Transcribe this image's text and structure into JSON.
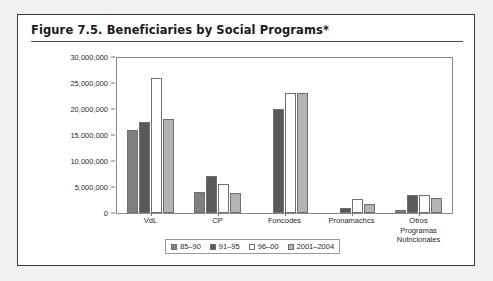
{
  "figure": {
    "title": "Figure 7.5.  Beneficiaries by Social Programs*"
  },
  "chart_data": {
    "type": "bar",
    "title": "Figure 7.5.  Beneficiaries by Social Programs*",
    "xlabel": "",
    "ylabel": "",
    "ylim": [
      0,
      30000000
    ],
    "ytick_labels": [
      "30,000,000",
      "25,000,000",
      "20,000,000",
      "15,000,000",
      "10,000,000",
      "5,000,000",
      "0"
    ],
    "ytick_values": [
      30000000,
      25000000,
      20000000,
      15000000,
      10000000,
      5000000,
      0
    ],
    "grid": false,
    "legend_position": "bottom",
    "categories": [
      "VdL",
      "CP",
      "Foncodes",
      "Pronamachcs",
      "Otros Programas Nutricionales"
    ],
    "series": [
      {
        "name": "85-90",
        "color": "#808080",
        "values": [
          16000000,
          4000000,
          0,
          0,
          600000
        ]
      },
      {
        "name": "91-95",
        "color": "#595959",
        "values": [
          17500000,
          7200000,
          20000000,
          900000,
          3400000
        ]
      },
      {
        "name": "96-00",
        "color": "#ffffff",
        "values": [
          26000000,
          5500000,
          23000000,
          2600000,
          3500000
        ]
      },
      {
        "name": "2001-2004",
        "color": "#b3b3b3",
        "values": [
          18000000,
          3800000,
          23000000,
          1800000,
          2900000
        ]
      }
    ]
  }
}
